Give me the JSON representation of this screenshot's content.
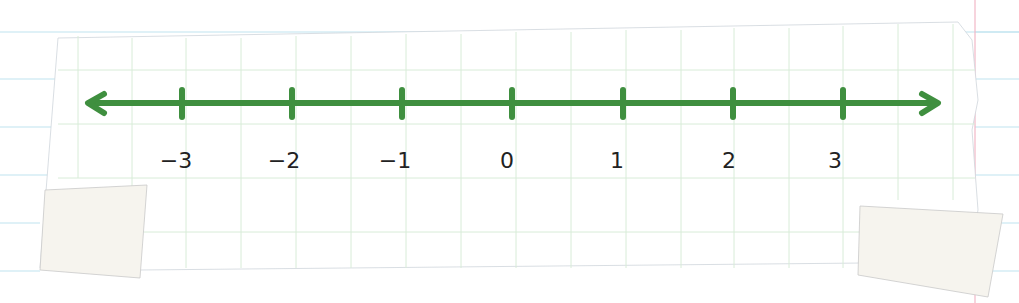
{
  "diagram": {
    "type": "number-line",
    "line_color": "#3f8f3f",
    "label_color": "#222222",
    "grid_color": "#d8ecd8",
    "ruled_line_color": "#bfe3f0",
    "margin_line_color": "#f2b8c6",
    "tape_color": "#f6f4ee",
    "ticks": [
      {
        "value": -3,
        "label": "−3",
        "x": 182
      },
      {
        "value": -2,
        "label": "−2",
        "x": 292
      },
      {
        "value": -1,
        "label": "−1",
        "x": 402
      },
      {
        "value": 0,
        "label": "0",
        "x": 512
      },
      {
        "value": 1,
        "label": "1",
        "x": 623
      },
      {
        "value": 2,
        "label": "2",
        "x": 733
      },
      {
        "value": 3,
        "label": "3",
        "x": 843
      }
    ],
    "arrows": {
      "left": true,
      "right": true
    }
  }
}
